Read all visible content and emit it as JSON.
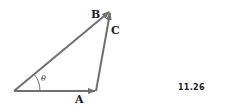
{
  "figure": {
    "number": "11.26",
    "angle_label": "θ",
    "vectors": [
      {
        "name": "A",
        "label": "A"
      },
      {
        "name": "B",
        "label": "B"
      },
      {
        "name": "C",
        "label": "C"
      }
    ],
    "colors": {
      "vector": "#6f6f6f",
      "text": "#222222"
    }
  }
}
